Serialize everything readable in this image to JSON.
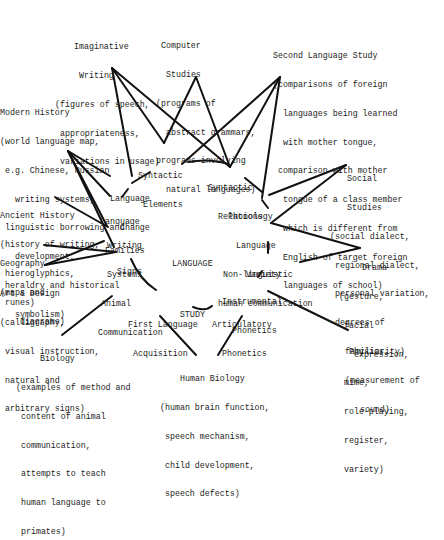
{
  "center": {
    "line1": "LANGUAGE",
    "line2": "STUDY"
  },
  "outer_subjects": {
    "imaginative_writing": {
      "title": [
        "Imaginative",
        "Writing"
      ],
      "details": [
        "(figures of speech,",
        " appropriateness,",
        " variations in usage)"
      ]
    },
    "computer_studies": {
      "title": [
        "Computer",
        "Studies"
      ],
      "details": [
        "(programs of",
        "  abstract grammars,",
        "programs involving",
        "  natural languages)"
      ]
    },
    "second_language_study": {
      "title": [
        "Second Language Study"
      ],
      "details": [
        "(comparisons of foreign",
        "  languages being learned",
        "  with mother tongue,",
        " comparison with mother",
        "  tongue of a class member",
        "  which is different from",
        "  English of target foreign",
        "  languages of school)"
      ]
    },
    "modern_history": {
      "title": [
        "Modern History"
      ],
      "details": [
        "(world language map,",
        " e.g. Chinese, Russian",
        "   writing systems,",
        " linguistic borrowing and",
        "   development,",
        " heraldry and historical",
        "   symbolism)"
      ]
    },
    "ancient_history": {
      "title": [
        "Ancient History"
      ],
      "details": [
        "(history of writing,",
        " hieroglyphics,",
        " runes)"
      ]
    },
    "geography": {
      "title": [
        "Geography"
      ],
      "details": [
        "(maps and",
        "    diagrams)"
      ]
    },
    "art_design": {
      "title": [
        "Art & Design"
      ],
      "details": [
        "(calligraphy,",
        " visual instruction,",
        " natural and",
        " arbitrary signs)"
      ]
    },
    "biology": {
      "title": [
        "Biology"
      ],
      "details": [
        "(examples of method and",
        " content of animal",
        " communication,",
        " attempts to teach",
        " human language to",
        " primates)"
      ]
    },
    "human_biology": {
      "title": [
        "Human Biology"
      ],
      "details": [
        "(human brain function,",
        " speech mechanism,",
        " child development,",
        " speech defects)"
      ]
    },
    "physics": {
      "title": [
        "Physics"
      ],
      "details": [
        "(measurement of",
        "   sound)"
      ]
    },
    "drama": {
      "title": [
        "Drama"
      ],
      "details": [
        "(gesture,",
        " facial",
        "   expression,",
        " mime,",
        " role-playing,",
        " register,",
        " variety)"
      ]
    },
    "social_studies": {
      "title": [
        "Social",
        "Studies"
      ],
      "details": [
        "(social dialect,",
        " regional dialect,",
        " personal variation,",
        " degrees of",
        "   familiarity)"
      ]
    }
  },
  "inner_topics": {
    "syntactic_elements": [
      "Syntactic",
      " Elements"
    ],
    "syntactic_relations": [
      "Syntactic",
      "  Relations"
    ],
    "language_change": [
      "Language",
      "  Change"
    ],
    "language_families": [
      "Language",
      " Families"
    ],
    "writing_systems": [
      "Writing",
      "Systems"
    ],
    "signs": [
      "Signs"
    ],
    "animal_communication": [
      "Animal",
      "Communication"
    ],
    "first_language_acquisition": [
      "First Language",
      " Acquisition"
    ],
    "articulatory_phonetics": [
      "Articulatory",
      "  Phonetics"
    ],
    "instrumental_phonetics": [
      "Instrumental",
      "  Phonetics"
    ],
    "non_linguistic": [
      "Non-linguistic",
      "human communication"
    ],
    "language_variety": [
      "Language",
      "  Variety"
    ],
    "phonology": [
      "Phonology"
    ]
  }
}
